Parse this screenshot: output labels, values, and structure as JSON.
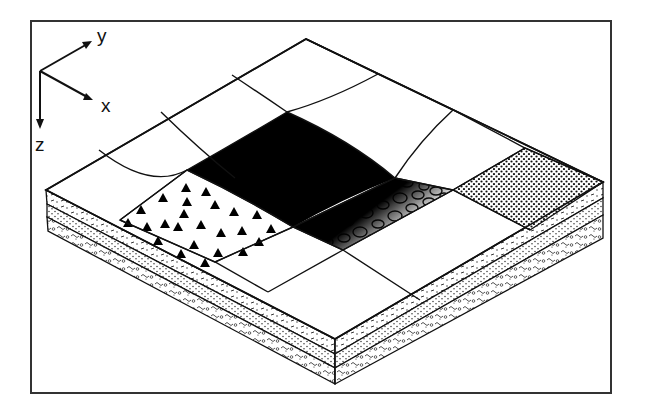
{
  "figure": {
    "type": "isometric block diagram",
    "frame": {
      "stroke": "#333333"
    },
    "colors": {
      "line": "#111111",
      "background": "#ffffff",
      "fill_dark": "#000000"
    }
  },
  "axes": {
    "x_label": "x",
    "y_label": "y",
    "z_label": "z"
  },
  "grid": {
    "rows": 4,
    "cols": 4
  },
  "zones": [
    {
      "id": "triangles",
      "pattern": "black triangles",
      "cell": "row 3, col 2"
    },
    {
      "id": "black",
      "pattern": "solid black",
      "cell": "row 2-3, col 3"
    },
    {
      "id": "circles",
      "pattern": "open ellipses with gradient from black",
      "cell": "row 3, col 3"
    },
    {
      "id": "dotted",
      "pattern": "fine dot stipple",
      "cell": "row 4, col 2"
    }
  ],
  "layers": [
    {
      "id": "layer-1",
      "pattern": "dashes and dots"
    },
    {
      "id": "layer-2",
      "pattern": "fine dots"
    },
    {
      "id": "layer-3",
      "pattern": "squiggles and pebbles"
    }
  ]
}
